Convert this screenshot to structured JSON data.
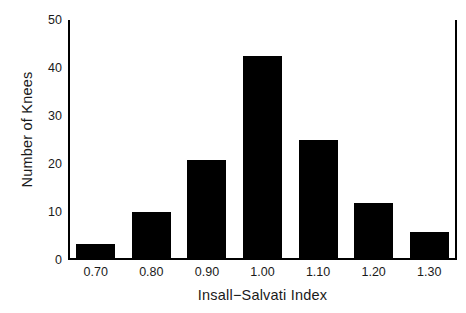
{
  "chart_data": {
    "type": "bar",
    "title": "",
    "xlabel": "Insall−Salvati Index",
    "ylabel": "Number of Knees",
    "categories": [
      "0.70",
      "0.80",
      "0.90",
      "1.00",
      "1.10",
      "1.20",
      "1.30"
    ],
    "values": [
      3,
      9.5,
      20.5,
      42,
      24.5,
      11.5,
      5.5
    ],
    "xtick_labels": [
      "0.70",
      "0.80",
      "0.90",
      "1.00",
      "1.10",
      "1.20",
      "1.30"
    ],
    "ytick_labels": [
      "0",
      "10",
      "20",
      "30",
      "40",
      "50"
    ],
    "ytick_values": [
      0,
      10,
      20,
      30,
      40,
      50
    ],
    "ylim": [
      0,
      50
    ],
    "grid": false,
    "legend": "none",
    "bar_color": "#000000",
    "background_color": "#ffffff",
    "axis_color": "#000000"
  }
}
